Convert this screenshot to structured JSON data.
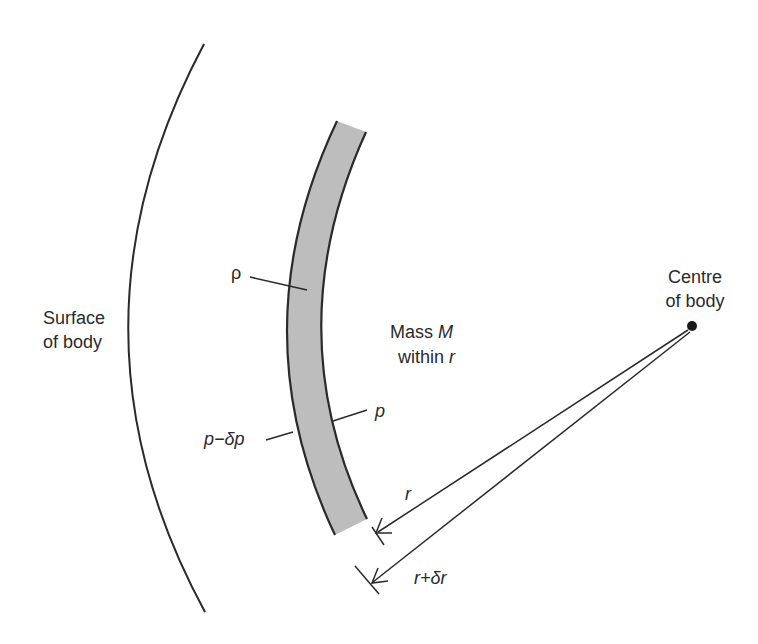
{
  "diagram": {
    "labels": {
      "surface_line1": "Surface",
      "surface_line2": "of body",
      "centre_line1": "Centre",
      "centre_line2": "of body",
      "mass_line1_prefix": "Mass ",
      "mass_line1_symbol": "M",
      "mass_line2_prefix": "within ",
      "mass_line2_symbol": "r",
      "density": "ρ",
      "pressure_inner": "p",
      "pressure_outer": "p−δp",
      "radius": "r",
      "radius_plus": "r+δr"
    },
    "colors": {
      "line": "#2a2a2a",
      "shell_fill": "#bdbdbd",
      "background": "#ffffff"
    }
  }
}
